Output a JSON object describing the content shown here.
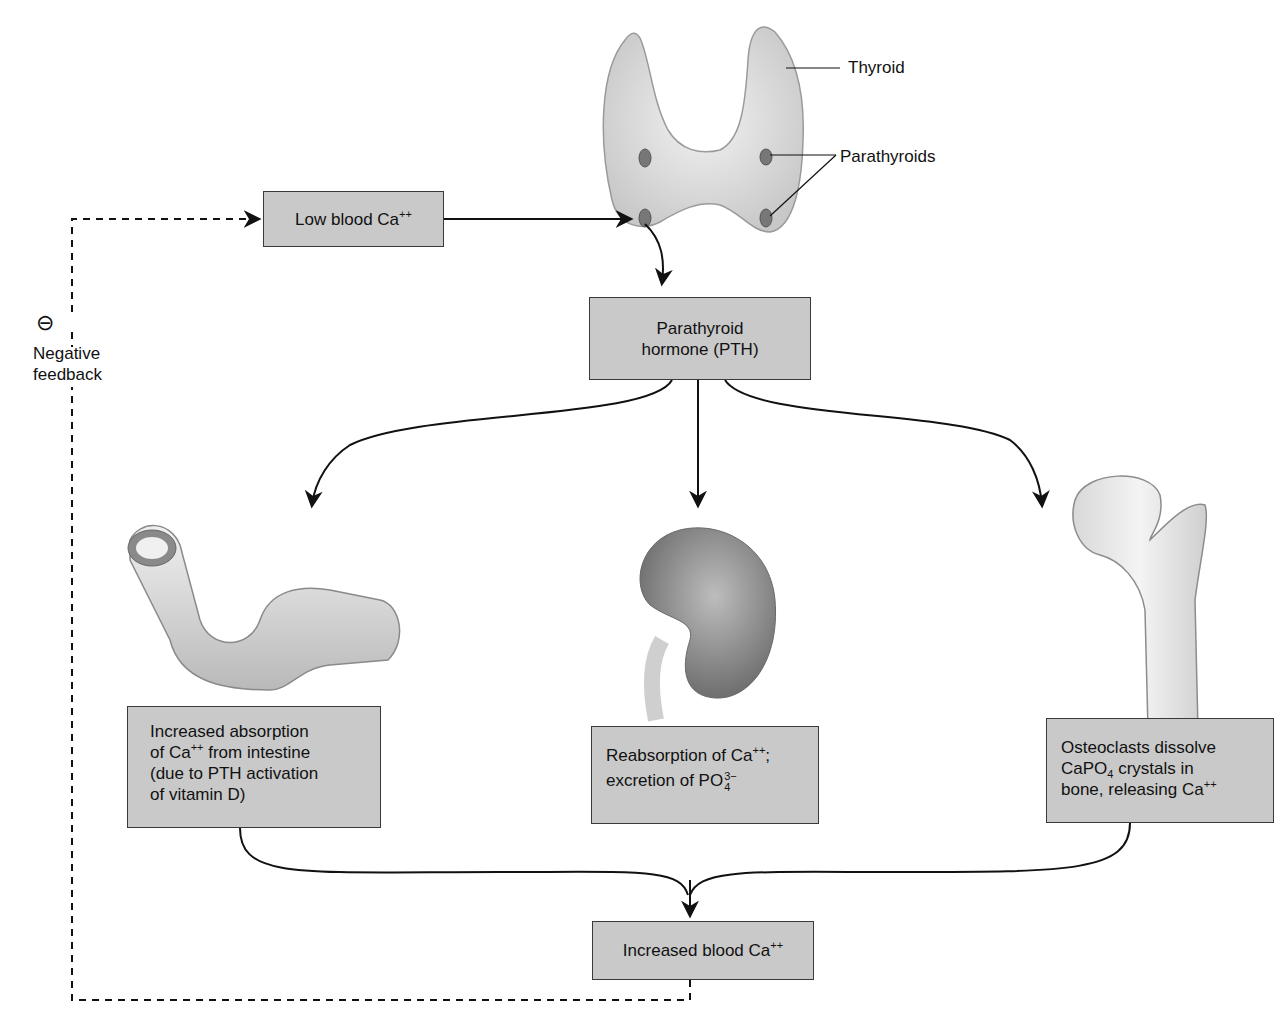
{
  "diagram": {
    "labels": {
      "thyroid": "Thyroid",
      "parathyroids": "Parathyroids",
      "negative_symbol": "⊖",
      "negative_feedback_line1": "Negative",
      "negative_feedback_line2": "feedback"
    },
    "nodes": {
      "low_ca": {
        "text": "Low blood Ca",
        "sup": "++"
      },
      "pth": {
        "line1": "Parathyroid",
        "line2": "hormone (PTH)"
      },
      "intestine": {
        "line1": "Increased absorption",
        "line2_pre": "of Ca",
        "line2_sup": "++",
        "line2_post": " from intestine",
        "line3": "(due to PTH activation",
        "line4": "of vitamin D)"
      },
      "kidney": {
        "line1_pre": "Reabsorption of Ca",
        "line1_sup": "++",
        "line1_post": ";",
        "line2_pre": "excretion of PO",
        "line2_sup": "3−",
        "line2_sub": "4"
      },
      "bone": {
        "line1": "Osteoclasts dissolve",
        "line2_pre": "CaPO",
        "line2_sub": "4",
        "line2_post": " crystals in",
        "line3_pre": "bone, releasing Ca",
        "line3_sup": "++"
      },
      "increased_ca": {
        "text": "Increased blood Ca",
        "sup": "++"
      }
    },
    "organs": [
      "thyroid-gland",
      "parathyroid-glands",
      "intestine",
      "kidney",
      "femur-bone"
    ],
    "colors": {
      "box_fill": "#c9c9c9",
      "box_border": "#3a3a3a",
      "arrow": "#111111",
      "organ_fill": "#e6e6e6"
    }
  }
}
